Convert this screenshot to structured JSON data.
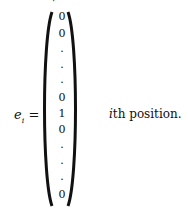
{
  "equation": {
    "lhs_symbol": "e",
    "lhs_subscript": "i",
    "equals": "=",
    "vector_entries": [
      "0",
      "0",
      ".",
      ".",
      ".",
      "0",
      "1",
      "0",
      ".",
      ".",
      ".",
      "0"
    ],
    "annotation_var": "i",
    "annotation_text": "th position."
  },
  "top_fragment": "·"
}
